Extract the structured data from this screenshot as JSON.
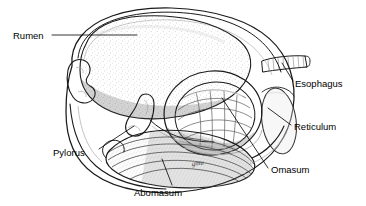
{
  "figure": {
    "background_color": "#ffffff",
    "ink_color": "#1a1a1a",
    "label_color": "#000000",
    "width": 366,
    "height": 206
  },
  "labels": [
    {
      "id": "rumen",
      "text": "Rumen",
      "text_x": 13,
      "text_y": 39,
      "leader": "M52,35 L137,35",
      "anchor": "start"
    },
    {
      "id": "esophagus",
      "text": "Esophagus",
      "text_x": 295,
      "text_y": 87,
      "leader": "M282,63 L293,81",
      "anchor": "start"
    },
    {
      "id": "reticulum",
      "text": "Reticulum",
      "text_x": 294,
      "text_y": 130,
      "leader": "M268,108 L291,125",
      "anchor": "start"
    },
    {
      "id": "omasum",
      "text": "Omasum",
      "text_x": 271,
      "text_y": 173,
      "leader": "M222,98 L268,168",
      "anchor": "start"
    },
    {
      "id": "pylorus",
      "text": "Pylorus",
      "text_x": 53,
      "text_y": 156,
      "leader": "M99,149 L134,126",
      "anchor": "start"
    },
    {
      "id": "abomasum",
      "text": "Abomasum",
      "text_x": 134,
      "text_y": 196,
      "leader": "M172,185 L162,159",
      "anchor": "start"
    }
  ],
  "signature": {
    "text": "gmu",
    "x": 192,
    "y": 166
  },
  "structures": {
    "rumen_fill": "#8d8d8d",
    "rumen_highlight": "#b5b5b5",
    "outer_wall_fill": "#f0f0ee",
    "outer_wall_shade": "#c9c9c7",
    "omasum_fill": "#cfcfcf",
    "reticulum_fill": "#6f6f6f",
    "abomasum_fill": "#a8a8a8",
    "esophagus_fill": "#b8b8b8"
  }
}
